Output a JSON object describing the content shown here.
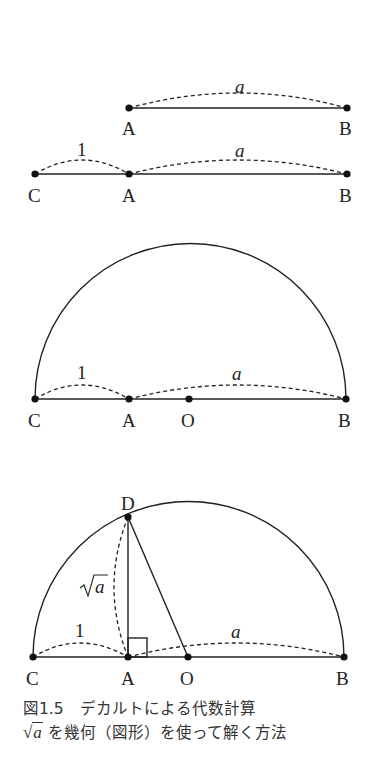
{
  "figure": {
    "step1": {
      "points": [
        "A",
        "B"
      ],
      "arc_label": "a"
    },
    "step2": {
      "points": [
        "C",
        "A",
        "B"
      ],
      "arc_labels": [
        "1",
        "a"
      ]
    },
    "step3": {
      "points": [
        "C",
        "A",
        "O",
        "B"
      ],
      "arc_labels": [
        "1",
        "a"
      ]
    },
    "step4": {
      "points": [
        "D",
        "C",
        "A",
        "O",
        "B"
      ],
      "arc_labels": [
        "1",
        "a"
      ],
      "sqrt_label": "√a"
    }
  },
  "caption": {
    "line1": "図1.5　デカルトによる代数計算",
    "line2_math": "√a",
    "line2_symbol": "√",
    "line2_var": "a",
    "line2_text": " を幾何（図形）を使って解く方法"
  }
}
